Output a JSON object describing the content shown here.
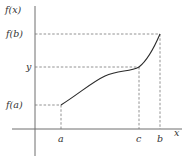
{
  "diagram": {
    "y_axis_label": "f(x)",
    "x_axis_label": "x",
    "y_ticks": [
      {
        "label": "f(b)",
        "y": 34
      },
      {
        "label": "y",
        "y": 67
      },
      {
        "label": "f(a)",
        "y": 105
      }
    ],
    "x_ticks": [
      {
        "label": "a",
        "x": 61
      },
      {
        "label": "c",
        "x": 139
      },
      {
        "label": "b",
        "x": 160
      }
    ],
    "points": {
      "a_point": {
        "x": 61,
        "y": 105
      },
      "c_point": {
        "x": 139,
        "y": 67
      },
      "b_point": {
        "x": 160,
        "y": 34
      }
    },
    "colors": {
      "axis": "#6e6e6e",
      "curve": "#2b2b2b",
      "guides": "#777777",
      "text": "#333333"
    }
  }
}
